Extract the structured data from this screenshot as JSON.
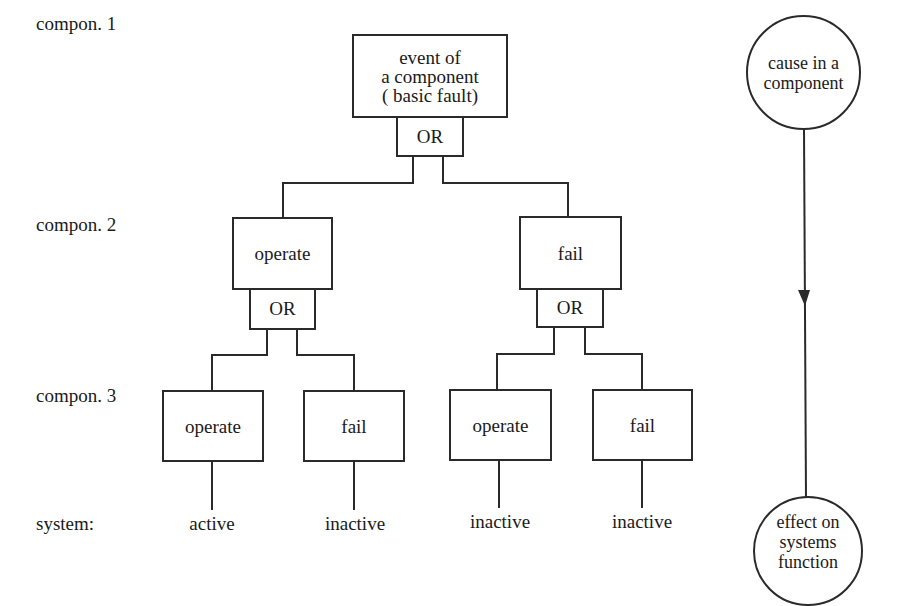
{
  "level_labels": [
    "compon. 1",
    "compon. 2",
    "compon. 3",
    "system:"
  ],
  "top_event": {
    "label": "event of\na component\n( basic fault)",
    "gate": "OR"
  },
  "level2": [
    {
      "label": "operate",
      "gate": "OR"
    },
    {
      "label": "fail",
      "gate": "OR"
    }
  ],
  "level3": [
    {
      "label": "operate"
    },
    {
      "label": "fail"
    },
    {
      "label": "operate"
    },
    {
      "label": "fail"
    }
  ],
  "system_states": [
    "active",
    "inactive",
    "inactive",
    "inactive"
  ],
  "legend": {
    "cause": "cause in a\ncomponent",
    "effect": "effect on\nsystems\nfunction"
  },
  "colors": {
    "line": "#2a2a2a",
    "background": "#ffffff",
    "text": "#1a1a1a"
  }
}
